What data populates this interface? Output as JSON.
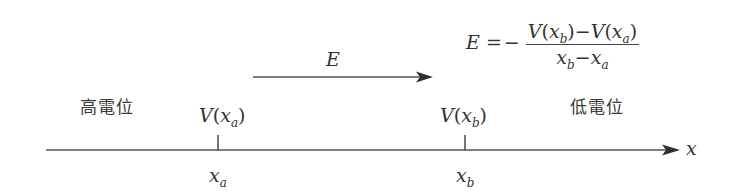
{
  "diagram": {
    "type": "potential-field-line",
    "axis": {
      "label": "x",
      "direction": "right"
    },
    "field_arrow": {
      "label": "E",
      "direction": "right"
    },
    "regions": {
      "high_potential": "高電位",
      "low_potential": "低電位"
    },
    "points": [
      {
        "position_var": "x",
        "position_sub": "a",
        "potential_var": "V",
        "potential_open": "(",
        "potential_close": ")"
      },
      {
        "position_var": "x",
        "position_sub": "b",
        "potential_var": "V",
        "potential_open": "(",
        "potential_close": ")"
      }
    ],
    "formula": {
      "lhs": "E",
      "equals": "=",
      "sign": "−",
      "numerator": {
        "term1_var": "V",
        "term1_arg": "x",
        "term1_sub": "b",
        "minus": "−",
        "term2_var": "V",
        "term2_arg": "x",
        "term2_sub": "a"
      },
      "denominator": {
        "term1": "x",
        "term1_sub": "b",
        "minus": "−",
        "term2": "x",
        "term2_sub": "a"
      }
    },
    "colors": {
      "line": "#4a4a40",
      "text": "#333330"
    }
  }
}
